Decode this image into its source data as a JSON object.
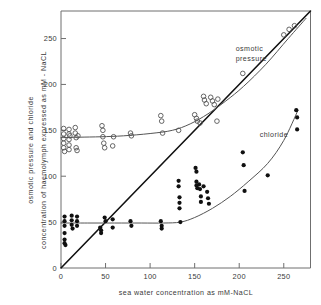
{
  "chart_data": {
    "type": "scatter",
    "title": "",
    "xlabel": "sea water concentration as mM-NaCL",
    "ylabel_line1": "osmotic pressure and chloride",
    "ylabel_line2": "concentration of haemolymph expressed as  mM - NaCL",
    "xlim": [
      0,
      280
    ],
    "ylim": [
      0,
      280
    ],
    "xticks": [
      0,
      50,
      100,
      150,
      200,
      250
    ],
    "yticks": [
      0,
      50,
      100,
      150,
      200,
      250
    ],
    "xticklabels": [
      "0",
      "50",
      "100",
      "150",
      "200",
      "250"
    ],
    "yticklabels": [
      "0",
      "50",
      "100",
      "150",
      "200",
      "250"
    ],
    "grid": false,
    "legend_position": "in-plot annotations",
    "annotations": [
      {
        "text": "osmotic",
        "x": 196,
        "y": 236
      },
      {
        "text": "pressure",
        "x": 196,
        "y": 226
      },
      {
        "text": "chloride",
        "x": 223,
        "y": 143
      }
    ],
    "series": [
      {
        "name": "isosmotic line",
        "type": "line",
        "marker": "none",
        "color": "#111111",
        "linewidth": 1.6,
        "x": [
          0,
          280
        ],
        "y": [
          0,
          280
        ]
      },
      {
        "name": "osmotic pressure",
        "type": "scatter",
        "marker": "open-circle",
        "color": "#555555",
        "points": [
          {
            "x": 3,
            "y": 152
          },
          {
            "x": 3,
            "y": 146
          },
          {
            "x": 3,
            "y": 141
          },
          {
            "x": 3,
            "y": 136
          },
          {
            "x": 3,
            "y": 131
          },
          {
            "x": 4,
            "y": 127
          },
          {
            "x": 9,
            "y": 151
          },
          {
            "x": 9,
            "y": 146
          },
          {
            "x": 9,
            "y": 140
          },
          {
            "x": 9,
            "y": 134
          },
          {
            "x": 9,
            "y": 129
          },
          {
            "x": 10,
            "y": 144
          },
          {
            "x": 16,
            "y": 153
          },
          {
            "x": 16,
            "y": 147
          },
          {
            "x": 17,
            "y": 142
          },
          {
            "x": 17,
            "y": 131
          },
          {
            "x": 18,
            "y": 128
          },
          {
            "x": 19,
            "y": 144
          },
          {
            "x": 46,
            "y": 155
          },
          {
            "x": 47,
            "y": 150
          },
          {
            "x": 47,
            "y": 143
          },
          {
            "x": 48,
            "y": 136
          },
          {
            "x": 49,
            "y": 131
          },
          {
            "x": 58,
            "y": 133
          },
          {
            "x": 59,
            "y": 143
          },
          {
            "x": 78,
            "y": 147
          },
          {
            "x": 79,
            "y": 144
          },
          {
            "x": 112,
            "y": 166
          },
          {
            "x": 113,
            "y": 160
          },
          {
            "x": 114,
            "y": 147
          },
          {
            "x": 132,
            "y": 150
          },
          {
            "x": 150,
            "y": 167
          },
          {
            "x": 152,
            "y": 163
          },
          {
            "x": 153,
            "y": 160
          },
          {
            "x": 156,
            "y": 158
          },
          {
            "x": 160,
            "y": 187
          },
          {
            "x": 161,
            "y": 183
          },
          {
            "x": 163,
            "y": 179
          },
          {
            "x": 168,
            "y": 186
          },
          {
            "x": 170,
            "y": 182
          },
          {
            "x": 172,
            "y": 178
          },
          {
            "x": 175,
            "y": 160
          },
          {
            "x": 176,
            "y": 184
          },
          {
            "x": 204,
            "y": 212
          },
          {
            "x": 250,
            "y": 254
          },
          {
            "x": 256,
            "y": 260
          },
          {
            "x": 262,
            "y": 264
          }
        ]
      },
      {
        "name": "osmotic pressure curve",
        "type": "line",
        "marker": "none",
        "color": "#555555",
        "linewidth": 1.0,
        "x": [
          0,
          20,
          45,
          70,
          100,
          125,
          145,
          165,
          185,
          205,
          230,
          255,
          275
        ],
        "y": [
          142,
          142.5,
          143,
          144,
          146.5,
          150,
          157,
          168,
          182,
          198,
          222,
          250,
          272
        ]
      },
      {
        "name": "chloride",
        "type": "scatter",
        "marker": "filled-circle",
        "color": "#101010",
        "points": [
          {
            "x": 4,
            "y": 56
          },
          {
            "x": 4,
            "y": 51
          },
          {
            "x": 4,
            "y": 46
          },
          {
            "x": 4,
            "y": 38
          },
          {
            "x": 4,
            "y": 31
          },
          {
            "x": 4,
            "y": 27
          },
          {
            "x": 5,
            "y": 25
          },
          {
            "x": 12,
            "y": 57
          },
          {
            "x": 12,
            "y": 52
          },
          {
            "x": 12,
            "y": 47
          },
          {
            "x": 13,
            "y": 43
          },
          {
            "x": 18,
            "y": 56
          },
          {
            "x": 18,
            "y": 51
          },
          {
            "x": 18,
            "y": 46
          },
          {
            "x": 44,
            "y": 44
          },
          {
            "x": 45,
            "y": 41
          },
          {
            "x": 45,
            "y": 38
          },
          {
            "x": 49,
            "y": 55
          },
          {
            "x": 50,
            "y": 51
          },
          {
            "x": 58,
            "y": 53
          },
          {
            "x": 58,
            "y": 44
          },
          {
            "x": 78,
            "y": 51
          },
          {
            "x": 79,
            "y": 46
          },
          {
            "x": 112,
            "y": 51
          },
          {
            "x": 113,
            "y": 46
          },
          {
            "x": 113,
            "y": 43
          },
          {
            "x": 132,
            "y": 95
          },
          {
            "x": 132,
            "y": 89
          },
          {
            "x": 133,
            "y": 77
          },
          {
            "x": 133,
            "y": 71
          },
          {
            "x": 133,
            "y": 65
          },
          {
            "x": 134,
            "y": 50
          },
          {
            "x": 151,
            "y": 109
          },
          {
            "x": 152,
            "y": 105
          },
          {
            "x": 152,
            "y": 94
          },
          {
            "x": 152,
            "y": 90
          },
          {
            "x": 153,
            "y": 87
          },
          {
            "x": 155,
            "y": 91
          },
          {
            "x": 156,
            "y": 86
          },
          {
            "x": 157,
            "y": 78
          },
          {
            "x": 157,
            "y": 72
          },
          {
            "x": 160,
            "y": 89
          },
          {
            "x": 164,
            "y": 83
          },
          {
            "x": 165,
            "y": 76
          },
          {
            "x": 166,
            "y": 70
          },
          {
            "x": 204,
            "y": 126
          },
          {
            "x": 205,
            "y": 112
          },
          {
            "x": 206,
            "y": 84
          },
          {
            "x": 232,
            "y": 101
          },
          {
            "x": 264,
            "y": 172
          },
          {
            "x": 265,
            "y": 164
          },
          {
            "x": 265,
            "y": 151
          }
        ]
      },
      {
        "name": "chloride curve",
        "type": "line",
        "marker": "none",
        "color": "#555555",
        "linewidth": 1.0,
        "x": [
          0,
          30,
          60,
          90,
          115,
          134,
          150,
          170,
          190,
          210,
          232,
          250,
          266
        ],
        "y": [
          49,
          49,
          49,
          49,
          49,
          50,
          55,
          65,
          78,
          94,
          114,
          139,
          172
        ]
      }
    ]
  }
}
